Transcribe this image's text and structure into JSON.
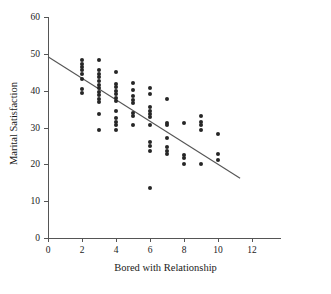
{
  "chart_data": {
    "type": "scatter",
    "title": "",
    "xlabel": "Bored with Relationship",
    "ylabel": "Marital Satisfaction",
    "xlim": [
      0,
      13
    ],
    "ylim": [
      0,
      60
    ],
    "xticks": [
      0,
      2,
      4,
      6,
      8,
      10,
      12
    ],
    "yticks": [
      0,
      10,
      20,
      30,
      40,
      50,
      60
    ],
    "xtick_labels": [
      "0",
      "2",
      "4",
      "6",
      "8",
      "10",
      "12"
    ],
    "ytick_labels": [
      "0",
      "10",
      "20",
      "30",
      "40",
      "50",
      "60"
    ],
    "grid": false,
    "legend": false,
    "marker": "filled-circle",
    "marker_color": "#262626",
    "axis_color": "#555555",
    "series": [
      {
        "name": "observations",
        "points": [
          [
            2,
            48.3
          ],
          [
            2,
            47.3
          ],
          [
            2,
            46.4
          ],
          [
            2,
            45.5
          ],
          [
            2,
            44.6
          ],
          [
            2,
            43.1
          ],
          [
            2,
            40.4
          ],
          [
            2,
            39.3
          ],
          [
            3,
            48.3
          ],
          [
            3,
            45.6
          ],
          [
            3,
            44.6
          ],
          [
            3,
            43.6
          ],
          [
            3,
            42.6
          ],
          [
            3,
            41.6
          ],
          [
            3,
            40.6
          ],
          [
            3,
            39.7
          ],
          [
            3,
            38.7
          ],
          [
            3,
            37.7
          ],
          [
            3,
            36.8
          ],
          [
            3,
            33.6
          ],
          [
            3,
            29.4
          ],
          [
            4,
            45.0
          ],
          [
            4,
            41.9
          ],
          [
            4,
            40.9
          ],
          [
            4,
            40.0
          ],
          [
            4,
            39.0
          ],
          [
            4,
            38.0
          ],
          [
            4,
            37.1
          ],
          [
            4,
            34.6
          ],
          [
            4,
            32.5
          ],
          [
            4,
            31.5
          ],
          [
            4,
            30.6
          ],
          [
            4,
            29.4
          ],
          [
            5,
            42.0
          ],
          [
            5,
            40.2
          ],
          [
            5,
            38.6
          ],
          [
            5,
            37.6
          ],
          [
            5,
            36.6
          ],
          [
            5,
            34.0
          ],
          [
            5,
            33.0
          ],
          [
            5,
            30.6
          ],
          [
            6,
            40.7
          ],
          [
            6,
            39.0
          ],
          [
            6,
            35.6
          ],
          [
            6,
            34.6
          ],
          [
            6,
            33.7
          ],
          [
            6,
            32.8
          ],
          [
            6,
            30.6
          ],
          [
            6,
            26.0
          ],
          [
            6,
            25.0
          ],
          [
            6,
            23.6
          ],
          [
            6,
            13.7
          ],
          [
            7,
            37.7
          ],
          [
            7,
            31.3
          ],
          [
            7,
            30.7
          ],
          [
            7,
            27.2
          ],
          [
            7,
            24.6
          ],
          [
            7,
            23.7
          ],
          [
            7,
            22.8
          ],
          [
            8,
            31.3
          ],
          [
            8,
            22.6
          ],
          [
            8,
            21.8
          ],
          [
            8,
            20.0
          ],
          [
            9,
            33.0
          ],
          [
            9,
            31.6
          ],
          [
            9,
            30.8
          ],
          [
            9,
            29.4
          ],
          [
            9,
            20.0
          ],
          [
            10,
            28.1
          ],
          [
            10,
            22.8
          ],
          [
            10,
            21.2
          ]
        ]
      }
    ],
    "trendline": {
      "name": "regression-line",
      "x0": 0.0,
      "y0": 49.2,
      "x1": 11.3,
      "y1": 16.2,
      "color": "#555555"
    }
  }
}
